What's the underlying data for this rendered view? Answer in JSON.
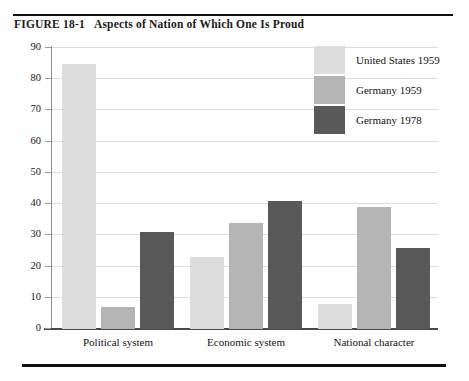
{
  "figure": {
    "label": "FIGURE 18-1",
    "caption": "Aspects of Nation of Which One Is Proud"
  },
  "chart_data": {
    "type": "bar",
    "title": "Aspects of Nation of Which One Is Proud",
    "xlabel": "",
    "ylabel": "",
    "ylim": [
      0,
      90
    ],
    "yticks": [
      0,
      10,
      20,
      30,
      40,
      50,
      60,
      70,
      80,
      90
    ],
    "grid": true,
    "legend_position": "top-right",
    "categories": [
      "Political system",
      "Economic system",
      "National character"
    ],
    "series": [
      {
        "name": "United States 1959",
        "color": "#dcdcdc",
        "values": [
          85,
          23,
          8
        ]
      },
      {
        "name": "Germany 1959",
        "color": "#b4b4b4",
        "values": [
          7,
          34,
          39
        ]
      },
      {
        "name": "Germany 1978",
        "color": "#595959",
        "values": [
          31,
          41,
          26
        ]
      }
    ]
  },
  "axis": {
    "tick_labels": [
      "90",
      "80",
      "70",
      "60",
      "50",
      "40",
      "30",
      "20",
      "10",
      "0"
    ]
  },
  "legend": {
    "entries": [
      {
        "label": "United States 1959"
      },
      {
        "label": "Germany 1959"
      },
      {
        "label": "Germany 1978"
      }
    ]
  },
  "colors": {
    "series_1": "#dcdcdc",
    "series_2": "#b4b4b4",
    "series_3": "#595959",
    "gridline": "#dcdcdc",
    "axis": "#4a4a4a",
    "rule": "#111111"
  }
}
